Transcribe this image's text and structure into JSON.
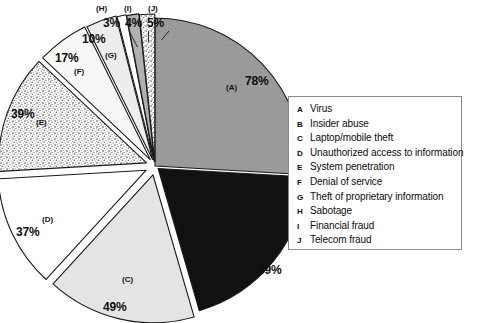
{
  "chart_data": {
    "type": "pie",
    "title": "",
    "subtitle": "",
    "xlabel": "",
    "ylabel": "",
    "note": "Exploded pie chart of computer crime / security incident types; percentages are survey response rates and sum to more than 100%.",
    "legend_position": "right",
    "grid": false,
    "total_of_values": 301,
    "categories": [
      "Virus",
      "Insider abuse",
      "Laptop/mobile theft",
      "Unauthorized access to information",
      "System penetration",
      "Denial of service",
      "Theft of proprietary information",
      "Sabotage",
      "Financial fraud",
      "Telecom fraud"
    ],
    "keys": [
      "A",
      "B",
      "C",
      "D",
      "E",
      "F",
      "G",
      "H",
      "I",
      "J"
    ],
    "values": [
      78,
      59,
      49,
      37,
      39,
      17,
      10,
      3,
      4,
      5
    ],
    "value_labels": [
      "78%",
      "59%",
      "49%",
      "37%",
      "39%",
      "17%",
      "10%",
      "3%",
      "4%",
      "5%"
    ],
    "slice_labels": [
      "(A)",
      "(B)",
      "(C)",
      "(D)",
      "(E)",
      "(F)",
      "(G)",
      "(H)",
      "(I)",
      "(J)"
    ],
    "fills": [
      "#9a9a9a",
      "#121212",
      "#e4e4e4",
      "#ffffff",
      "#d6d6d6",
      "#f7f7f7",
      "#ededed",
      "#ffffff",
      "#b0b0b0",
      "#d2d2d2"
    ],
    "fill_names": [
      "medium-gray",
      "near-black",
      "light-gray",
      "white",
      "speckled-gray",
      "off-white",
      "very-light-gray",
      "white",
      "gray",
      "speckled-gray"
    ]
  },
  "legend": {
    "items": [
      {
        "key": "A",
        "label": "Virus"
      },
      {
        "key": "B",
        "label": "Insider abuse"
      },
      {
        "key": "C",
        "label": "Laptop/mobile theft"
      },
      {
        "key": "D",
        "label": "Unauthorized access to information"
      },
      {
        "key": "E",
        "label": "System penetration"
      },
      {
        "key": "F",
        "label": "Denial of service"
      },
      {
        "key": "G",
        "label": "Theft of proprietary information"
      },
      {
        "key": "H",
        "label": "Sabotage"
      },
      {
        "key": "I",
        "label": "Financial fraud"
      },
      {
        "key": "J",
        "label": "Telecom fraud"
      }
    ]
  },
  "colors": {
    "background": "#ffffff",
    "stroke": "#1a1a1a",
    "legend_border": "#8a8a8a",
    "text": "#0c0c0c"
  }
}
